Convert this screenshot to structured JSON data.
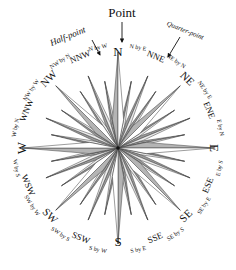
{
  "figure": {
    "center": {
      "x": 118,
      "y": 148
    },
    "outer_ring_radius": 113,
    "star_max_radius": 88,
    "colors": {
      "background": "#ffffff",
      "outline": "#3a3a3a",
      "facet_light": "#ffffff",
      "facet_mid": "#ededed",
      "facet_dark": "#b4b4b4",
      "facet_darker": "#9a9a9a",
      "text": "#111111",
      "annotation_arrow": "#111111"
    }
  },
  "annotations": [
    {
      "id": "point",
      "label": "Point",
      "x": 122,
      "y": 14,
      "rotate": 0,
      "size": 13,
      "style": "normal",
      "arrow": {
        "x1": 122,
        "y1": 22,
        "x2": 122,
        "y2": 42
      }
    },
    {
      "id": "half-point",
      "label": "Half-point",
      "x": 68,
      "y": 37,
      "rotate": -22,
      "size": 9,
      "style": "italic",
      "arrow": {
        "x1": 92,
        "y1": 40,
        "x2": 100,
        "y2": 55
      }
    },
    {
      "id": "quarter-point",
      "label": "Quarter-point",
      "x": 185,
      "y": 31,
      "rotate": 22,
      "size": 7,
      "style": "italic",
      "arrow": {
        "x1": 180,
        "y1": 37,
        "x2": 168,
        "y2": 57
      }
    }
  ],
  "points": [
    {
      "name": "N",
      "abbr": "N",
      "angle": 0,
      "tier": 1,
      "size": 13,
      "radius": 96,
      "label_radius": 95
    },
    {
      "name": "N by E",
      "abbr": "N by E",
      "angle": 11.25,
      "tier": 4,
      "size": 6,
      "radius": 68,
      "label_radius": 102
    },
    {
      "name": "NNE",
      "abbr": "NNE",
      "angle": 22.5,
      "tier": 3,
      "size": 9,
      "radius": 78,
      "label_radius": 98
    },
    {
      "name": "NE by N",
      "abbr": "NE by N",
      "angle": 33.75,
      "tier": 4,
      "size": 6,
      "radius": 68,
      "label_radius": 104
    },
    {
      "name": "NE",
      "abbr": "NE",
      "angle": 45,
      "tier": 2,
      "size": 11,
      "radius": 88,
      "label_radius": 97
    },
    {
      "name": "NE by E",
      "abbr": "NE by E",
      "angle": 56.25,
      "tier": 4,
      "size": 6,
      "radius": 68,
      "label_radius": 104
    },
    {
      "name": "ENE",
      "abbr": "ENE",
      "angle": 67.5,
      "tier": 3,
      "size": 9,
      "radius": 78,
      "label_radius": 98
    },
    {
      "name": "E by N",
      "abbr": "E by N",
      "angle": 78.75,
      "tier": 4,
      "size": 6,
      "radius": 68,
      "label_radius": 104
    },
    {
      "name": "E",
      "abbr": "E",
      "angle": 90,
      "tier": 1,
      "size": 13,
      "radius": 96,
      "label_radius": 95
    },
    {
      "name": "E by S",
      "abbr": "E by S",
      "angle": 101.25,
      "tier": 4,
      "size": 6,
      "radius": 68,
      "label_radius": 104
    },
    {
      "name": "ESE",
      "abbr": "ESE",
      "angle": 112.5,
      "tier": 3,
      "size": 9,
      "radius": 78,
      "label_radius": 98
    },
    {
      "name": "SE by E",
      "abbr": "SE by E",
      "angle": 123.75,
      "tier": 4,
      "size": 6,
      "radius": 68,
      "label_radius": 104
    },
    {
      "name": "SE",
      "abbr": "SE",
      "angle": 135,
      "tier": 2,
      "size": 11,
      "radius": 88,
      "label_radius": 97
    },
    {
      "name": "SE by S",
      "abbr": "SE by S",
      "angle": 146.25,
      "tier": 4,
      "size": 6,
      "radius": 68,
      "label_radius": 104
    },
    {
      "name": "SSE",
      "abbr": "SSE",
      "angle": 157.5,
      "tier": 3,
      "size": 9,
      "radius": 78,
      "label_radius": 98
    },
    {
      "name": "S by E",
      "abbr": "S by E",
      "angle": 168.75,
      "tier": 4,
      "size": 6,
      "radius": 68,
      "label_radius": 104
    },
    {
      "name": "S",
      "abbr": "S",
      "angle": 180,
      "tier": 1,
      "size": 13,
      "radius": 96,
      "label_radius": 95
    },
    {
      "name": "S by W",
      "abbr": "S by W",
      "angle": 191.25,
      "tier": 4,
      "size": 6,
      "radius": 68,
      "label_radius": 104
    },
    {
      "name": "SSW",
      "abbr": "SSW",
      "angle": 202.5,
      "tier": 3,
      "size": 9,
      "radius": 78,
      "label_radius": 98
    },
    {
      "name": "SW by S",
      "abbr": "SW by S",
      "angle": 213.75,
      "tier": 4,
      "size": 6,
      "radius": 68,
      "label_radius": 104
    },
    {
      "name": "SW",
      "abbr": "SW",
      "angle": 225,
      "tier": 2,
      "size": 11,
      "radius": 88,
      "label_radius": 97
    },
    {
      "name": "SW by W",
      "abbr": "SW by W",
      "angle": 236.25,
      "tier": 4,
      "size": 6,
      "radius": 68,
      "label_radius": 104
    },
    {
      "name": "WSW",
      "abbr": "WSW",
      "angle": 247.5,
      "tier": 3,
      "size": 9,
      "radius": 78,
      "label_radius": 98
    },
    {
      "name": "W by S",
      "abbr": "W by S",
      "angle": 258.75,
      "tier": 4,
      "size": 6,
      "radius": 68,
      "label_radius": 104
    },
    {
      "name": "W",
      "abbr": "W",
      "angle": 270,
      "tier": 1,
      "size": 13,
      "radius": 96,
      "label_radius": 95
    },
    {
      "name": "W by N",
      "abbr": "W by N",
      "angle": 281.25,
      "tier": 4,
      "size": 6,
      "radius": 68,
      "label_radius": 104
    },
    {
      "name": "WNW",
      "abbr": "WNW",
      "angle": 292.5,
      "tier": 3,
      "size": 9,
      "radius": 78,
      "label_radius": 98
    },
    {
      "name": "NW by W",
      "abbr": "NW by W",
      "angle": 303.75,
      "tier": 4,
      "size": 6,
      "radius": 68,
      "label_radius": 104
    },
    {
      "name": "NW",
      "abbr": "NW",
      "angle": 315,
      "tier": 2,
      "size": 11,
      "radius": 88,
      "label_radius": 97
    },
    {
      "name": "NW by N",
      "abbr": "NW by N",
      "angle": 326.25,
      "tier": 4,
      "size": 6,
      "radius": 68,
      "label_radius": 104
    },
    {
      "name": "NNW",
      "abbr": "NNW",
      "angle": 337.5,
      "tier": 3,
      "size": 9,
      "radius": 78,
      "label_radius": 98
    },
    {
      "name": "N by W",
      "abbr": "N by W",
      "angle": 348.75,
      "tier": 4,
      "size": 6,
      "radius": 68,
      "label_radius": 102
    }
  ]
}
